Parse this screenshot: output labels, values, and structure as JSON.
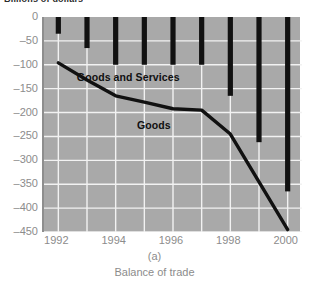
{
  "figure": {
    "axis_title": "Billions of dollars",
    "caption_letter": "(a)",
    "caption_text": "Balance of trade"
  },
  "colors": {
    "plot_background": "#a9a9a9",
    "gridline": "#f2f2f2",
    "bar": "#111111",
    "line": "#111111",
    "tick_label": "#8c8c8c",
    "annotation": "#101010"
  },
  "chart_data": {
    "type": "bar",
    "title": "Billions of dollars",
    "subtitle": "Balance of trade",
    "xlabel": "",
    "ylabel": "Billions of dollars",
    "x": [
      1992,
      1993,
      1994,
      1995,
      1996,
      1997,
      1998,
      1999,
      2000
    ],
    "xlim": [
      1991.5,
      2000.5
    ],
    "ylim": [
      -450,
      0
    ],
    "yticks": [
      0,
      -50,
      -100,
      -150,
      -200,
      -250,
      -300,
      -350,
      -400,
      -450
    ],
    "ytick_labels": [
      "0",
      "–50",
      "–100",
      "–150",
      "–200",
      "–250",
      "–300",
      "–350",
      "–400",
      "–450"
    ],
    "xticks": [
      1992,
      1994,
      1996,
      1998,
      2000
    ],
    "xtick_labels": [
      "1992",
      "1994",
      "1996",
      "1998",
      "2000"
    ],
    "grid": true,
    "legend": "inline-annotations",
    "series": [
      {
        "name": "Goods and Services",
        "render": "bar",
        "values": [
          -35,
          -65,
          -100,
          -100,
          -100,
          -100,
          -165,
          -262,
          -365
        ]
      },
      {
        "name": "Goods",
        "render": "line",
        "values": [
          -96,
          -132,
          -165,
          -178,
          -192,
          -195,
          -245,
          -345,
          -445
        ]
      }
    ],
    "annotations": [
      {
        "text": "Goods and Services",
        "x": 1994.6,
        "y": -128
      },
      {
        "text": "Goods",
        "x": 1996.7,
        "y": -228
      }
    ]
  }
}
